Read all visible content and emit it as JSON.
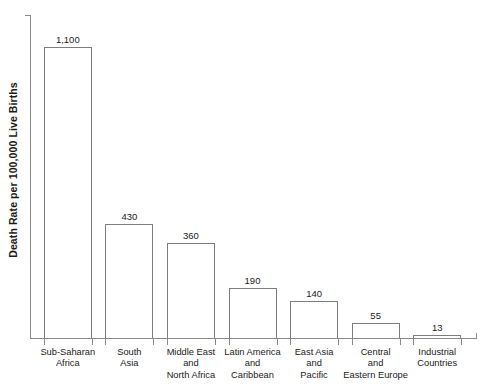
{
  "chart_data": {
    "type": "bar",
    "title": "",
    "subtitle": "",
    "xlabel": "",
    "ylabel": "Death Rate per 100,000 Live Births",
    "ylim": [
      0,
      1220
    ],
    "grid": false,
    "legend": false,
    "categories": [
      "Sub-Saharan\nAfrica",
      "South\nAsia",
      "Middle East\nand\nNorth Africa",
      "Latin America\nand\nCaribbean",
      "East Asia\nand\nPacific",
      "Central\nand\nEastern Europe",
      "Industrial\nCountries"
    ],
    "values": [
      1100,
      430,
      360,
      190,
      140,
      55,
      13
    ],
    "value_labels": [
      "1,100",
      "430",
      "360",
      "190",
      "140",
      "55",
      "13"
    ],
    "colors": {
      "bar_fill": "#ffffff",
      "bar_stroke": "#7d7d7d",
      "axis": "#8a8a8a",
      "text": "#1a1a1a",
      "background": "#ffffff"
    }
  },
  "categories_lines": [
    [
      "Sub-Saharan",
      "Africa"
    ],
    [
      "South",
      "Asia"
    ],
    [
      "Middle East",
      "and",
      "North Africa"
    ],
    [
      "Latin America",
      "and",
      "Caribbean"
    ],
    [
      "East Asia",
      "and",
      "Pacific"
    ],
    [
      "Central",
      "and",
      "Eastern Europe"
    ],
    [
      "Industrial",
      "Countries"
    ]
  ]
}
